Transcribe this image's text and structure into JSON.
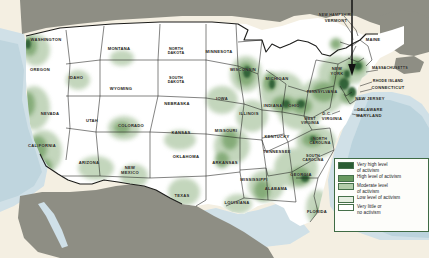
{
  "figure": {
    "name": "us-activism-choropleth-map",
    "background_color": "#f4efe2",
    "land_color": "#ffffff",
    "foreign_land_color": "#8e8e84",
    "water_color": "#c2d9e4",
    "border_color": "#1d1d1b"
  },
  "annotation": {
    "pointer_label": "callout-arrow",
    "description": "vertical line with downward arrowhead pointing at the New York / New Jersey metropolitan area"
  },
  "legend": {
    "name": "activism-level-legend",
    "items": [
      {
        "label": "Very high level\nof activism",
        "color": "#2b5c32"
      },
      {
        "label": "High level of activism",
        "color": "#69995f"
      },
      {
        "label": "Moderate level\nof activism",
        "color": "#b3cdaa"
      },
      {
        "label": "Low level of activism",
        "color": "#e6eee2"
      },
      {
        "label": "Very little or\nno activism",
        "color": "#ffffff"
      }
    ]
  },
  "map": {
    "states": [
      {
        "name": "WASHINGTON",
        "label": "WASHINGTON",
        "x": 46,
        "y": 40
      },
      {
        "name": "OREGON",
        "label": "OREGON",
        "x": 40,
        "y": 70
      },
      {
        "name": "CALIFORNIA",
        "label": "CALIFORNIA",
        "x": 42,
        "y": 146
      },
      {
        "name": "NEVADA",
        "label": "NEVADA",
        "x": 50,
        "y": 114
      },
      {
        "name": "IDAHO",
        "label": "IDAHO",
        "x": 76,
        "y": 78
      },
      {
        "name": "MONTANA",
        "label": "MONTANA",
        "x": 119,
        "y": 49
      },
      {
        "name": "WYOMING",
        "label": "WYOMING",
        "x": 121,
        "y": 89
      },
      {
        "name": "UTAH",
        "label": "UTAH",
        "x": 92,
        "y": 121
      },
      {
        "name": "ARIZONA",
        "label": "ARIZONA",
        "x": 89,
        "y": 163
      },
      {
        "name": "COLORADO",
        "label": "COLORADO",
        "x": 131,
        "y": 126
      },
      {
        "name": "NEW MEXICO",
        "label": "NEW\nMEXICO",
        "x": 130,
        "y": 171
      },
      {
        "name": "NORTH DAKOTA",
        "label": "NORTH\nDAKOTA",
        "x": 176,
        "y": 51
      },
      {
        "name": "SOUTH DAKOTA",
        "label": "SOUTH\nDAKOTA",
        "x": 176,
        "y": 80
      },
      {
        "name": "NEBRASKA",
        "label": "NEBRASKA",
        "x": 177,
        "y": 104
      },
      {
        "name": "KANSAS",
        "label": "KANSAS",
        "x": 181,
        "y": 133
      },
      {
        "name": "OKLAHOMA",
        "label": "OKLAHOMA",
        "x": 186,
        "y": 157
      },
      {
        "name": "TEXAS",
        "label": "TEXAS",
        "x": 182,
        "y": 196
      },
      {
        "name": "MINNESOTA",
        "label": "MINNESOTA",
        "x": 219,
        "y": 52
      },
      {
        "name": "IOWA",
        "label": "IOWA",
        "x": 222,
        "y": 99
      },
      {
        "name": "MISSOURI",
        "label": "MISSOURI",
        "x": 226,
        "y": 131
      },
      {
        "name": "ARKANSAS",
        "label": "ARKANSAS",
        "x": 225,
        "y": 163
      },
      {
        "name": "LOUISIANA",
        "label": "LOUISIANA",
        "x": 237,
        "y": 203
      },
      {
        "name": "WISCONSIN",
        "label": "WISCONSIN",
        "x": 243,
        "y": 70
      },
      {
        "name": "ILLINOIS",
        "label": "ILLINOIS",
        "x": 249,
        "y": 114
      },
      {
        "name": "MISSISSIPPI",
        "label": "MISSISSIPPI",
        "x": 254,
        "y": 180
      },
      {
        "name": "MICHIGAN",
        "label": "MICHIGAN",
        "x": 277,
        "y": 79
      },
      {
        "name": "INDIANA",
        "label": "INDIANA",
        "x": 273,
        "y": 106
      },
      {
        "name": "OHIO",
        "label": "OHIO",
        "x": 294,
        "y": 106
      },
      {
        "name": "KENTUCKY",
        "label": "KENTUCKY",
        "x": 277,
        "y": 137
      },
      {
        "name": "TENNESSEE",
        "label": "TENNESSEE",
        "x": 277,
        "y": 152
      },
      {
        "name": "ALABAMA",
        "label": "ALABAMA",
        "x": 276,
        "y": 189
      },
      {
        "name": "GEORGIA",
        "label": "GEORGIA",
        "x": 301,
        "y": 175
      },
      {
        "name": "FLORIDA",
        "label": "FLORIDA",
        "x": 317,
        "y": 212
      },
      {
        "name": "SOUTH CAROLINA",
        "label": "SOUTH\nCAROLINA",
        "x": 313,
        "y": 158
      },
      {
        "name": "NORTH CAROLINA",
        "label": "NORTH\nCAROLINA",
        "x": 320,
        "y": 141
      },
      {
        "name": "WEST VIRGINIA",
        "label": "WEST\nVIRGINIA",
        "x": 310,
        "y": 121
      },
      {
        "name": "VIRGINIA",
        "label": "VIRGINIA",
        "x": 332,
        "y": 119
      },
      {
        "name": "DISTRICT OF COLUMBIA",
        "label": "D.C.",
        "x": 327,
        "y": 114
      },
      {
        "name": "PENNSYLVANIA",
        "label": "PENNSYLVANIA",
        "x": 322,
        "y": 92
      },
      {
        "name": "NEW YORK",
        "label": "NEW\nYORK",
        "x": 337,
        "y": 72
      },
      {
        "name": "NEW JERSEY",
        "label": "NEW JERSEY",
        "x": 370,
        "y": 99
      },
      {
        "name": "DELAWARE",
        "label": "DELAWARE",
        "x": 370,
        "y": 110
      },
      {
        "name": "MARYLAND",
        "label": "MARYLAND",
        "x": 369,
        "y": 116
      },
      {
        "name": "MASSACHUSETTS",
        "label": "MASSACHUSETTS",
        "x": 390,
        "y": 68
      },
      {
        "name": "RHODE ISLAND",
        "label": "RHODE ISLAND",
        "x": 388,
        "y": 81
      },
      {
        "name": "CONNECTICUT",
        "label": "CONNECTICUT",
        "x": 388,
        "y": 88
      },
      {
        "name": "NEW HAMPSHIRE",
        "label": "NEW HAMPSHIRE",
        "x": 336,
        "y": 15
      },
      {
        "name": "VERMONT",
        "label": "VERMONT",
        "x": 336,
        "y": 21
      },
      {
        "name": "MAINE",
        "label": "MAINE",
        "x": 373,
        "y": 40
      }
    ]
  }
}
